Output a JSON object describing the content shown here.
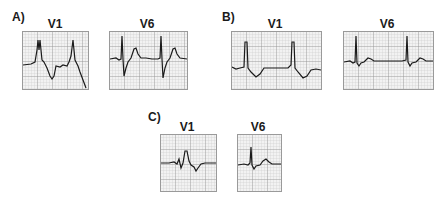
{
  "figure": {
    "panels": [
      {
        "id": "A",
        "label": "A)",
        "leads": [
          {
            "name": "V1",
            "description": "Tall dominant R wave with deep inverted T wave"
          },
          {
            "name": "V6",
            "description": "Deep S wave with upright T wave"
          }
        ]
      },
      {
        "id": "B",
        "label": "B)",
        "leads": [
          {
            "name": "V1",
            "description": "Tall R wave with small T inversion"
          },
          {
            "name": "V6",
            "description": "Tall R wave, small T wave"
          }
        ]
      },
      {
        "id": "C",
        "label": "C)",
        "leads": [
          {
            "name": "V1",
            "description": "rSR' pattern with T inversion"
          },
          {
            "name": "V6",
            "description": "Upright R wave with small S and T wave"
          }
        ]
      }
    ]
  },
  "colors": {
    "grid_bg": "#f2f2f2",
    "grid_minor": "#c4c4c4",
    "grid_major": "#8a8a8a",
    "trace": "#1a1a1a"
  }
}
